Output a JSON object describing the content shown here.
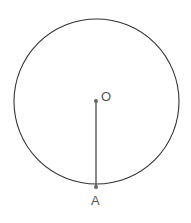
{
  "diagram": {
    "circle": {
      "cx": 96.5,
      "cy": 101.5,
      "r": 82.5,
      "stroke": "#333333"
    },
    "center": {
      "label": "O",
      "x": 96,
      "y": 101
    },
    "point_on_circle": {
      "label": "A",
      "x": 96,
      "y": 187
    },
    "segment": {
      "from": "O",
      "to": "A",
      "color": "#555555"
    }
  }
}
